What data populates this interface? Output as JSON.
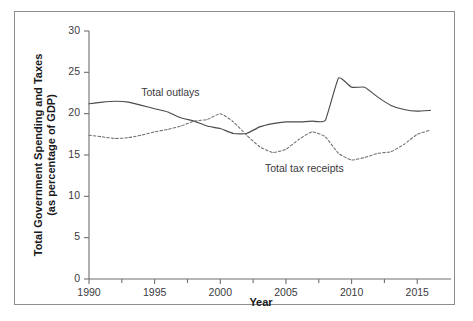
{
  "chart_data": {
    "type": "line",
    "title": "",
    "xlabel": "Year",
    "ylabel": "Total Government Spending and Taxes (as percentage of GDP)",
    "ylabel_line1": "Total Government Spending and Taxes",
    "ylabel_line2": "(as percentage of GDP)",
    "xlim": [
      1990,
      2016.2
    ],
    "ylim": [
      0,
      30
    ],
    "grid": false,
    "legend_position": "inline-annotations",
    "x_ticks": [
      1990,
      1995,
      2000,
      2005,
      2010,
      2015
    ],
    "x_tick_labels": [
      "1990",
      "1995",
      "2000",
      "2005",
      "2010",
      "2015"
    ],
    "x_minor_ticks": [
      1992.5,
      1997.5,
      2002.5,
      2007.5,
      2012.5
    ],
    "y_ticks": [
      0,
      5,
      10,
      15,
      20,
      25,
      30
    ],
    "y_tick_labels": [
      "0",
      "5",
      "10",
      "15",
      "20",
      "25",
      "30"
    ],
    "x": [
      1990,
      1991,
      1992,
      1993,
      1994,
      1995,
      1996,
      1997,
      1998,
      1999,
      2000,
      2001,
      2002,
      2003,
      2004,
      2005,
      2006,
      2007,
      2008,
      2009,
      2010,
      2011,
      2012,
      2013,
      2014,
      2015,
      2016
    ],
    "series": [
      {
        "name": "Total outlays",
        "style": "solid",
        "color": "#4b4b50",
        "annotation": "Total outlays",
        "annotation_x": 1996.2,
        "annotation_y": 22.1,
        "values": [
          21.2,
          21.4,
          21.5,
          21.4,
          21.0,
          20.6,
          20.2,
          19.5,
          19.1,
          18.5,
          18.2,
          17.6,
          17.6,
          18.4,
          18.8,
          19.0,
          19.0,
          19.1,
          19.2,
          24.3,
          23.2,
          23.2,
          22.0,
          21.0,
          20.5,
          20.3,
          20.4
        ]
      },
      {
        "name": "Total tax receipts",
        "style": "dotted",
        "color": "#6e6e73",
        "annotation": "Total tax receipts",
        "annotation_x": 2006.4,
        "annotation_y": 12.9,
        "values": [
          17.4,
          17.2,
          17.0,
          17.1,
          17.4,
          17.8,
          18.1,
          18.5,
          19.1,
          19.3,
          20.0,
          19.0,
          17.4,
          16.0,
          15.3,
          15.7,
          16.9,
          17.8,
          17.2,
          15.2,
          14.4,
          14.7,
          15.2,
          15.4,
          16.3,
          17.5,
          18.0
        ]
      }
    ]
  },
  "figure": {
    "caption_sliver": ""
  }
}
